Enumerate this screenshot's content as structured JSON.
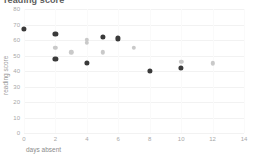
{
  "chart_data": {
    "type": "scatter",
    "title": "reading score",
    "xlabel": "days absent",
    "ylabel": "reading score",
    "xlim": [
      0,
      14
    ],
    "ylim": [
      0,
      80
    ],
    "grid": true,
    "legend": "none",
    "xticks": [
      "0",
      "2",
      "4",
      "6",
      "8",
      "10",
      "12",
      "14"
    ],
    "yticks": [
      "0",
      "10",
      "20",
      "30",
      "40",
      "50",
      "60",
      "70",
      "80"
    ],
    "series": [
      {
        "name": "dark points",
        "color": "#3a3a3a",
        "points": [
          {
            "x": 0,
            "y": 67
          },
          {
            "x": 2,
            "y": 64
          },
          {
            "x": 2,
            "y": 48
          },
          {
            "x": 4,
            "y": 45
          },
          {
            "x": 5,
            "y": 62
          },
          {
            "x": 6,
            "y": 61
          },
          {
            "x": 8,
            "y": 40
          },
          {
            "x": 10,
            "y": 42
          }
        ]
      },
      {
        "name": "light points",
        "color": "#c9c9c9",
        "points": [
          {
            "x": 2,
            "y": 55
          },
          {
            "x": 3,
            "y": 52
          },
          {
            "x": 4,
            "y": 60
          },
          {
            "x": 4,
            "y": 58
          },
          {
            "x": 5,
            "y": 52
          },
          {
            "x": 7,
            "y": 55
          },
          {
            "x": 10,
            "y": 46
          },
          {
            "x": 12,
            "y": 45
          }
        ]
      }
    ]
  }
}
